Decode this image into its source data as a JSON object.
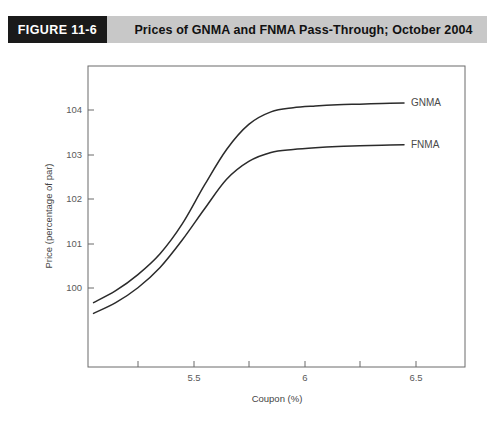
{
  "header": {
    "figure_tag": "FIGURE 11-6",
    "title": "Prices of GNMA and FNMA Pass-Through; October 2004",
    "tag_bg": "#1a1a1a",
    "band_bg": "#c8c8c8",
    "tag_text_color": "#ffffff"
  },
  "chart_data": {
    "type": "line",
    "title": "Prices of GNMA and FNMA Pass-Through; October 2004",
    "xlabel": "Coupon (%)",
    "ylabel": "Price (percentage of par)",
    "xlim": [
      5.175,
      6.875
    ],
    "ylim": [
      99.55,
      104.6
    ],
    "grid": false,
    "legend_position": "right-inline-labels",
    "x_ticks_major": [
      5.5,
      6,
      6.5
    ],
    "x_tick_labels": [
      "5.5",
      "6",
      "6.5"
    ],
    "x_ticks_minor": [
      5.25,
      5.75,
      6.25,
      6.75
    ],
    "y_ticks": [
      100,
      101,
      102,
      103,
      104
    ],
    "y_tick_labels": [
      "100",
      "101",
      "102",
      "103",
      "104"
    ],
    "line_color": "#2b2b2b",
    "series": [
      {
        "name": "GNMA",
        "label": "GNMA",
        "x": [
          5.2,
          5.3,
          5.4,
          5.5,
          5.6,
          5.7,
          5.8,
          5.9,
          6.0,
          6.1,
          6.2,
          6.3,
          6.4,
          6.5,
          6.6
        ],
        "values": [
          100.63,
          100.83,
          101.1,
          101.45,
          101.95,
          102.6,
          103.2,
          103.62,
          103.83,
          103.9,
          103.93,
          103.95,
          103.96,
          103.97,
          103.98
        ]
      },
      {
        "name": "FNMA",
        "label": "FNMA",
        "x": [
          5.2,
          5.3,
          5.4,
          5.5,
          5.6,
          5.7,
          5.8,
          5.9,
          6.0,
          6.1,
          6.2,
          6.3,
          6.4,
          6.5,
          6.6
        ],
        "values": [
          100.45,
          100.63,
          100.88,
          101.22,
          101.68,
          102.2,
          102.7,
          103.0,
          103.15,
          103.2,
          103.23,
          103.25,
          103.26,
          103.27,
          103.28
        ]
      }
    ]
  }
}
